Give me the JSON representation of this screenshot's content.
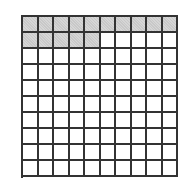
{
  "grid": {
    "rows": 10,
    "cols": 10,
    "shaded_count": 15,
    "shaded_color": "#c8c8c8",
    "line_color": "#333333",
    "description": "10x10 hundred grid with first row fully shaded and first 5 cells of second row shaded"
  }
}
